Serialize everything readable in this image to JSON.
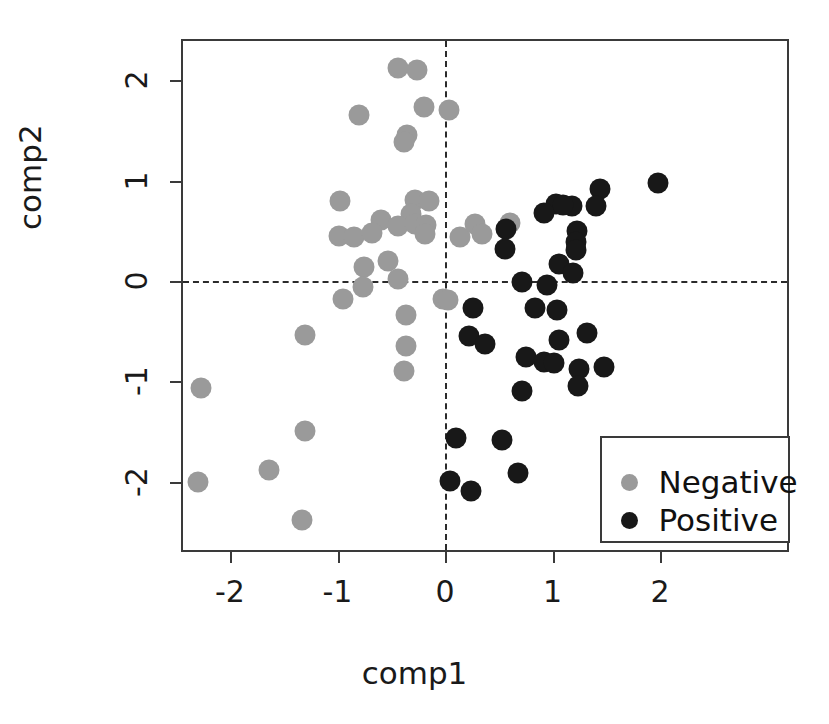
{
  "chart_data": {
    "type": "scatter",
    "title": "",
    "xlabel": "comp1",
    "ylabel": "comp2",
    "xlim": [
      -2.45,
      3.19
    ],
    "ylim": [
      -2.59,
      2.42
    ],
    "xticks": [
      -2,
      -1,
      0,
      1,
      2
    ],
    "xticklabels": [
      "-2",
      "-1",
      "0",
      "1",
      "2"
    ],
    "yticks": [
      -2,
      -1,
      0,
      1,
      2
    ],
    "yticklabels": [
      "-2",
      "-1",
      "0",
      "1",
      "2"
    ],
    "grid": false,
    "reference_lines": {
      "hline": 0,
      "vline": 0,
      "style": "dashed"
    },
    "legend": {
      "position": "bottom-right",
      "entries": [
        {
          "label": "Negative",
          "color": "#9a9a9a"
        },
        {
          "label": "Positive",
          "color": "#181818"
        }
      ]
    },
    "series": [
      {
        "name": "Negative",
        "color": "#9a9a9a",
        "marker": "circle",
        "points": [
          [
            -0.44,
            2.12
          ],
          [
            -0.26,
            2.1
          ],
          [
            -0.8,
            1.66
          ],
          [
            -0.2,
            1.73
          ],
          [
            -0.35,
            1.46
          ],
          [
            -0.38,
            1.39
          ],
          [
            0.04,
            1.7
          ],
          [
            -0.98,
            0.8
          ],
          [
            -0.28,
            0.81
          ],
          [
            -0.15,
            0.8
          ],
          [
            -0.32,
            0.67
          ],
          [
            -0.6,
            0.61
          ],
          [
            -0.44,
            0.55
          ],
          [
            -0.28,
            0.57
          ],
          [
            -0.18,
            0.56
          ],
          [
            -0.19,
            0.47
          ],
          [
            -0.99,
            0.45
          ],
          [
            -0.85,
            0.44
          ],
          [
            -0.68,
            0.48
          ],
          [
            0.14,
            0.44
          ],
          [
            0.28,
            0.57
          ],
          [
            0.34,
            0.47
          ],
          [
            -0.75,
            0.14
          ],
          [
            -0.53,
            0.2
          ],
          [
            -0.44,
            0.02
          ],
          [
            -0.76,
            -0.06
          ],
          [
            -0.95,
            -0.18
          ],
          [
            -0.02,
            -0.18
          ],
          [
            0.03,
            -0.19
          ],
          [
            -0.36,
            -0.34
          ],
          [
            -1.3,
            -0.54
          ],
          [
            -0.36,
            -0.65
          ],
          [
            -0.38,
            -0.9
          ],
          [
            -2.27,
            -1.07
          ],
          [
            -1.3,
            -1.5
          ],
          [
            -1.64,
            -1.88
          ],
          [
            -2.3,
            -2.0
          ],
          [
            -1.33,
            -2.38
          ],
          [
            0.6,
            0.58
          ]
        ]
      },
      {
        "name": "Positive",
        "color": "#181818",
        "marker": "circle",
        "points": [
          [
            1.98,
            0.98
          ],
          [
            1.44,
            0.92
          ],
          [
            1.4,
            0.75
          ],
          [
            1.03,
            0.77
          ],
          [
            1.18,
            0.75
          ],
          [
            0.92,
            0.68
          ],
          [
            1.1,
            0.76
          ],
          [
            1.23,
            0.5
          ],
          [
            1.22,
            0.39
          ],
          [
            1.22,
            0.31
          ],
          [
            1.06,
            0.17
          ],
          [
            1.19,
            0.08
          ],
          [
            0.57,
            0.52
          ],
          [
            0.56,
            0.32
          ],
          [
            0.72,
            -0.01
          ],
          [
            0.95,
            -0.04
          ],
          [
            0.26,
            -0.27
          ],
          [
            0.84,
            -0.27
          ],
          [
            1.04,
            -0.29
          ],
          [
            0.22,
            -0.55
          ],
          [
            0.37,
            -0.63
          ],
          [
            1.06,
            -0.59
          ],
          [
            1.32,
            -0.52
          ],
          [
            0.75,
            -0.76
          ],
          [
            0.92,
            -0.81
          ],
          [
            1.01,
            -0.82
          ],
          [
            1.25,
            -0.88
          ],
          [
            1.48,
            -0.86
          ],
          [
            1.24,
            -1.05
          ],
          [
            0.72,
            -1.1
          ],
          [
            0.1,
            -1.57
          ],
          [
            0.53,
            -1.59
          ],
          [
            0.68,
            -1.91
          ],
          [
            0.05,
            -1.99
          ],
          [
            0.24,
            -2.09
          ]
        ]
      }
    ]
  }
}
